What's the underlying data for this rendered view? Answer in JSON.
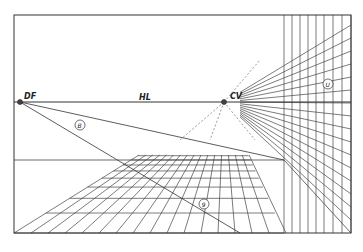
{
  "diagram": {
    "title": "",
    "type": "one-point perspective grid",
    "frame": {
      "left": 14,
      "top": 15,
      "right": 351,
      "bottom": 233
    },
    "horizon_line": {
      "label": "HL",
      "y": 102
    },
    "points": [
      {
        "id": "DF",
        "label": "DF",
        "x": 20,
        "y": 102
      },
      {
        "id": "CV",
        "label": "CV",
        "x": 224,
        "y": 102
      }
    ],
    "circled_labels": [
      {
        "id": "b",
        "label": "B",
        "x": 80,
        "y": 125
      },
      {
        "id": "u",
        "label": "U",
        "x": 328,
        "y": 84
      },
      {
        "id": "9",
        "label": "9",
        "x": 204,
        "y": 204
      }
    ],
    "floor": {
      "near_y": 233,
      "far_y": 155
    },
    "wall": {
      "left_x": 284,
      "right_x": 351
    },
    "stroke_color": "#333333",
    "background": "#ffffff"
  }
}
